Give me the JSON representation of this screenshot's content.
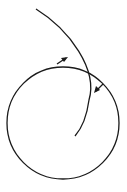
{
  "diagram": {
    "stroke_color": "#1a1a1a",
    "background": "#ffffff",
    "circle": {
      "cx": 63,
      "cy": 123,
      "r": 56
    },
    "arc": {
      "start": [
        36,
        9
      ],
      "control1": [
        70,
        35
      ],
      "control2": [
        100,
        80
      ],
      "end": [
        75,
        136
      ]
    },
    "arrows": [
      {
        "name": "arrow-on-circle",
        "x": 62,
        "y": 58,
        "direction": "up-right"
      },
      {
        "name": "arrow-on-arc",
        "x": 97,
        "y": 89,
        "direction": "down-left"
      }
    ]
  }
}
